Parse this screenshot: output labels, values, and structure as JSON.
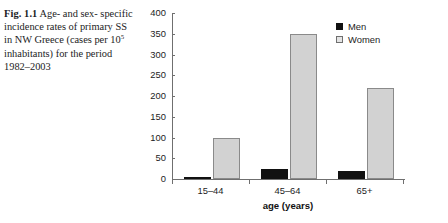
{
  "caption": {
    "label": "Fig. 1.1",
    "line1": "Age- and sex-",
    "line2": "specific incidence rates of",
    "line3": "primary SS in NW Greece",
    "line4_pre": "(cases per 10",
    "line4_sup": "5",
    "line4_post": " inhabitants)",
    "line5": "for the period 1982–2003"
  },
  "chart_data": {
    "type": "bar",
    "title": "",
    "xlabel": "age (years)",
    "ylabel": "",
    "categories": [
      "15–44",
      "45–64",
      "65+"
    ],
    "series": [
      {
        "name": "Men",
        "color": "#111111",
        "values": [
          5,
          23,
          20
        ]
      },
      {
        "name": "Women",
        "color": "#d2d2d2",
        "values": [
          100,
          350,
          220
        ]
      }
    ],
    "ylim": [
      0,
      400
    ],
    "yticks": [
      0,
      50,
      100,
      150,
      200,
      250,
      300,
      350,
      400
    ],
    "ytick_labels": [
      "0",
      "50",
      "100",
      "150",
      "200",
      "250",
      "300",
      "350",
      "400"
    ],
    "grid": false,
    "legend_position": "top-right",
    "legend": [
      "Men",
      "Women"
    ]
  },
  "legend": {
    "men": "Men",
    "women": "Women"
  }
}
